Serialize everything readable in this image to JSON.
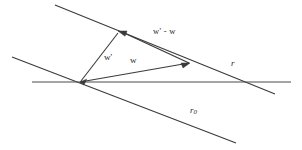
{
  "figure": {
    "background_color": "#ffffff",
    "stroke_color": "#3a3a3a",
    "labels": {
      "w_prime_minus_w": "w' - w",
      "w_prime": "w'",
      "w": "w",
      "r": "r",
      "r_zero": "r",
      "r_zero_subscript": "0"
    },
    "geometry": {
      "origin": [
        80,
        82
      ],
      "lines": [
        {
          "name": "line-r",
          "from": [
            55,
            5
          ],
          "to": [
            275,
            94
          ]
        },
        {
          "name": "line-r0",
          "from": [
            12,
            57
          ],
          "to": [
            236,
            143
          ]
        },
        {
          "name": "line-horizontal",
          "from": [
            32,
            82
          ],
          "to": [
            291,
            82
          ]
        }
      ],
      "vectors": [
        {
          "name": "vector-w-prime",
          "from": [
            80,
            82
          ],
          "to": [
            118,
            33
          ]
        },
        {
          "name": "vector-w",
          "from": [
            80,
            82
          ],
          "to": [
            189,
            63
          ]
        },
        {
          "name": "vector-w-prime-minus-w",
          "from": [
            189,
            63
          ],
          "to": [
            122,
            32
          ]
        }
      ]
    }
  }
}
